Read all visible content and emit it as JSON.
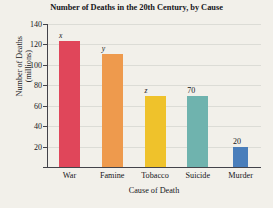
{
  "chart_data": {
    "type": "bar",
    "title": "Number of Deaths in the 20th Century, by Cause",
    "xlabel": "Cause of Death",
    "ylabel_line1": "Number of Deaths",
    "ylabel_line2": "(millions)",
    "categories": [
      "War",
      "Famine",
      "Tobacco",
      "Suicide",
      "Murder"
    ],
    "values": [
      123,
      111,
      70,
      70,
      20
    ],
    "data_labels": [
      "x",
      "y",
      "z",
      "70",
      "20"
    ],
    "data_label_styles": [
      "italic",
      "italic",
      "italic",
      "plain",
      "plain"
    ],
    "bar_colors": [
      "#e0465a",
      "#ee9a4d",
      "#efc22b",
      "#6fb3ae",
      "#4a7ebb"
    ],
    "ylim": [
      0,
      140
    ],
    "yticks": [
      0,
      20,
      40,
      60,
      80,
      100,
      120,
      140
    ],
    "ytick_labels": [
      "",
      "20",
      "40",
      "60",
      "80",
      "100",
      "120",
      "140"
    ],
    "grid": true,
    "legend": "none",
    "background_color": "#f2f0ea",
    "axis_color": "#43434a",
    "gridline_color": "#dcdcd6"
  }
}
